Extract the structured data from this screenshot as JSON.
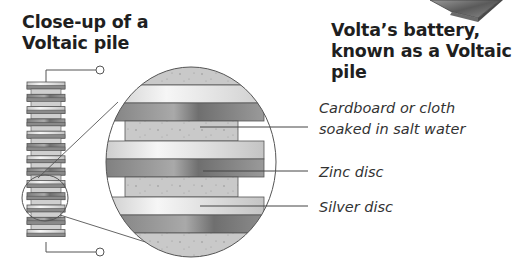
{
  "titles": {
    "left": [
      "Close-up of a",
      "Voltaic pile"
    ],
    "right": [
      "Volta’s battery,",
      "known as a Voltaic pile"
    ]
  },
  "labels": {
    "cardboard": [
      "Cardboard or cloth",
      "soaked in salt water"
    ],
    "zinc": "Zinc disc",
    "silver": "Silver disc"
  },
  "colors": {
    "zinc": "#8c8c8c",
    "silver": "#d9d9d9",
    "cardboard": "#c8c8c8",
    "outline": "#555555"
  },
  "icons": {
    "terminal": "terminal-circle-icon",
    "battery": "battery-photo-icon"
  }
}
